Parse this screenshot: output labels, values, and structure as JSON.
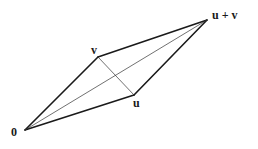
{
  "diagram": {
    "vertices": {
      "origin": {
        "label": "0",
        "x": 25,
        "y": 130
      },
      "v": {
        "label": "v",
        "x": 98,
        "y": 57
      },
      "u": {
        "label": "u",
        "x": 134,
        "y": 95
      },
      "u_plus_v": {
        "label": "u + v",
        "x": 207,
        "y": 20
      }
    },
    "edges": [
      {
        "from": "origin",
        "to": "v",
        "style": "thick"
      },
      {
        "from": "origin",
        "to": "u",
        "style": "thick"
      },
      {
        "from": "v",
        "to": "u_plus_v",
        "style": "thick"
      },
      {
        "from": "u",
        "to": "u_plus_v",
        "style": "thick"
      }
    ],
    "diagonals": [
      {
        "from": "origin",
        "to": "u_plus_v",
        "style": "thin"
      },
      {
        "from": "v",
        "to": "u",
        "style": "thin"
      }
    ],
    "colors": {
      "stroke": "#1a1a1a",
      "background": "#ffffff"
    }
  }
}
